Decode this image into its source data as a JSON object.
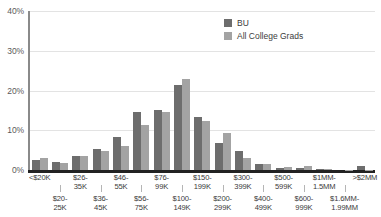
{
  "chart_data": {
    "type": "bar",
    "title": "",
    "xlabel": "",
    "ylabel": "",
    "ylim": [
      0,
      40
    ],
    "grid": true,
    "legend_position": "top-right",
    "y_ticks": [
      "0%",
      "10%",
      "20%",
      "30%",
      "40%"
    ],
    "y_tick_values": [
      0,
      10,
      20,
      30,
      40
    ],
    "categories": [
      "<$20K",
      "$20-25K",
      "$26-35K",
      "$36-45K",
      "$46-55K",
      "$56-75K",
      "$76-99K",
      "$100-149K",
      "$150-199K",
      "$200-299K",
      "$300-399K",
      "$400-499K",
      "$500-599K",
      "$600-999K",
      "$1MM-1.5MM",
      "$1.6MM-1.99MM",
      ">$2MM"
    ],
    "category_rows": [
      {
        "row": "top",
        "label": "<$20K"
      },
      {
        "row": "bottom",
        "label": "$20-\n25K"
      },
      {
        "row": "top",
        "label": "$26-\n35K"
      },
      {
        "row": "bottom",
        "label": "$36-\n45K"
      },
      {
        "row": "top",
        "label": "$46-\n55K"
      },
      {
        "row": "bottom",
        "label": "$56-\n75K"
      },
      {
        "row": "top",
        "label": "$76-\n99K"
      },
      {
        "row": "bottom",
        "label": "$100-\n149K"
      },
      {
        "row": "top",
        "label": "$150-\n199K"
      },
      {
        "row": "bottom",
        "label": "$200-\n299K"
      },
      {
        "row": "top",
        "label": "$300-\n399K"
      },
      {
        "row": "bottom",
        "label": "$400-\n499K"
      },
      {
        "row": "top",
        "label": "$500-\n599K"
      },
      {
        "row": "bottom",
        "label": "$600-\n999K"
      },
      {
        "row": "top",
        "label": "$1MM-\n1.5MM"
      },
      {
        "row": "bottom",
        "label": "$1.6MM-\n1.99MM"
      },
      {
        "row": "top",
        "label": ">$2MM"
      }
    ],
    "series": [
      {
        "name": "BU",
        "color": "#6d6d6d",
        "values": [
          2.6,
          1.9,
          3.5,
          5.2,
          8.2,
          14.5,
          15.0,
          21.5,
          13.4,
          6.7,
          4.9,
          1.4,
          0.5,
          0.5,
          0.2,
          0.0,
          0.9
        ]
      },
      {
        "name": "All College Grads",
        "color": "#a3a3a3",
        "values": [
          3.0,
          1.8,
          3.6,
          4.9,
          6.0,
          11.3,
          14.6,
          23.0,
          12.3,
          9.4,
          2.9,
          1.4,
          0.8,
          0.9,
          0.3,
          0.1,
          0.1
        ]
      }
    ]
  },
  "legend": {
    "items": [
      {
        "label": "BU"
      },
      {
        "label": "All College Grads"
      }
    ]
  },
  "colors": {
    "series_bu": "#6d6d6d",
    "series_acg": "#a3a3a3",
    "gridline": "#e3e3e3",
    "axis": "#222222",
    "text": "#3a3a3a",
    "background": "#ffffff"
  }
}
